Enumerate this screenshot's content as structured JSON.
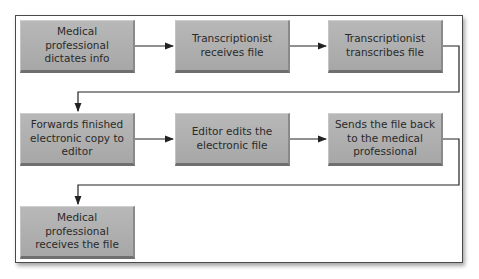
{
  "diagram": {
    "type": "flowchart",
    "colors": {
      "box_fill": "#adadad",
      "line": "#222222",
      "frame": "#4a4a4a"
    },
    "steps": [
      {
        "id": 1,
        "label": "Medical professional dictates info"
      },
      {
        "id": 2,
        "label": "Transcriptionist receives file"
      },
      {
        "id": 3,
        "label": "Transcriptionist transcribes file"
      },
      {
        "id": 4,
        "label": "Forwards finished electronic copy to editor"
      },
      {
        "id": 5,
        "label": "Editor edits the electronic file"
      },
      {
        "id": 6,
        "label": "Sends the file back to the medical professional"
      },
      {
        "id": 7,
        "label": "Medical professional receives the file"
      }
    ],
    "edges": [
      [
        1,
        2
      ],
      [
        2,
        3
      ],
      [
        3,
        4
      ],
      [
        4,
        5
      ],
      [
        5,
        6
      ],
      [
        6,
        7
      ]
    ]
  }
}
